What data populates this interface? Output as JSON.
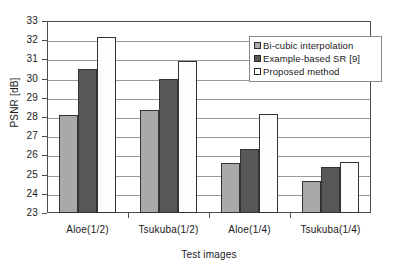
{
  "chart_data": {
    "type": "bar",
    "title": "",
    "xlabel": "Test images",
    "ylabel": "PSNR [dB]",
    "categories": [
      "Aloe(1/2)",
      "Tsukuba(1/2)",
      "Aloe(1/4)",
      "Tsukuba(1/4)"
    ],
    "series": [
      {
        "name": "Bi-cubic interpolation",
        "color": "#a9a9a9",
        "values": [
          28.1,
          28.35,
          25.6,
          24.65
        ]
      },
      {
        "name": "Example-based SR [9]",
        "color": "#575757",
        "values": [
          30.5,
          30.0,
          26.35,
          25.4
        ]
      },
      {
        "name": "Proposed method",
        "color": "#ffffff",
        "values": [
          32.15,
          30.9,
          28.15,
          25.65
        ]
      }
    ],
    "ylim": [
      23,
      33
    ],
    "ytick_labels": [
      "33",
      "32",
      "31",
      "30",
      "29",
      "28",
      "27",
      "26",
      "25",
      "24",
      "23"
    ],
    "yticks": [
      33,
      32,
      31,
      30,
      29,
      28,
      27,
      26,
      25,
      24,
      23
    ],
    "grid": true,
    "legend_position": "upper-right-inside"
  },
  "legend": {
    "items": [
      {
        "label": "Bi-cubic interpolation"
      },
      {
        "label": "Example-based SR [9]"
      },
      {
        "label": "Proposed method"
      }
    ]
  }
}
